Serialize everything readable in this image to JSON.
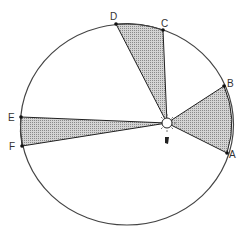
{
  "diagram": {
    "orbit": {
      "cx": 127,
      "cy": 124.5,
      "rx": 106.5,
      "ry": 100.5,
      "stroke": "#444444"
    },
    "sun": {
      "x": 167,
      "y": 123,
      "label": ""
    },
    "sector_fill": "#bdbdbd",
    "points": [
      {
        "label": "A",
        "x": 227,
        "y": 153,
        "lx": 232,
        "ly": 160
      },
      {
        "label": "B",
        "x": 224,
        "y": 86,
        "lx": 228,
        "ly": 85
      },
      {
        "label": "C",
        "x": 163,
        "y": 30,
        "lx": 163,
        "ly": 25
      },
      {
        "label": "D",
        "x": 116,
        "y": 24,
        "lx": 111,
        "ly": 20
      },
      {
        "label": "E",
        "x": 21,
        "y": 117,
        "lx": 8,
        "ly": 121
      },
      {
        "label": "F",
        "x": 22,
        "y": 146,
        "lx": 9,
        "ly": 151
      }
    ],
    "sectors": [
      {
        "name": "AB",
        "from": "A",
        "to": "B"
      },
      {
        "name": "CD",
        "from": "C",
        "to": "D"
      },
      {
        "name": "EF",
        "from": "E",
        "to": "F"
      }
    ]
  }
}
